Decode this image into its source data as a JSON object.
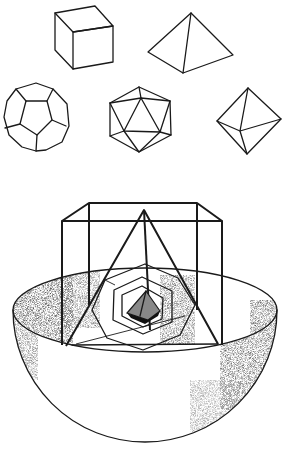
{
  "figure": {
    "solids": [
      {
        "name": "cube"
      },
      {
        "name": "tetrahedron"
      },
      {
        "name": "dodecahedron"
      },
      {
        "name": "icosahedron"
      },
      {
        "name": "octahedron"
      }
    ],
    "nested_model": {
      "outer_shape": "hemisphere",
      "layers": [
        "cube",
        "tetrahedron",
        "dodecahedron",
        "icosahedron",
        "octahedron"
      ]
    },
    "colors": {
      "ink": "#1a1a1a",
      "background": "#ffffff",
      "shading": "#555555"
    }
  }
}
